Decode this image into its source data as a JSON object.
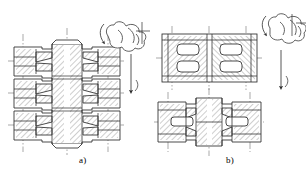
{
  "drawing": {
    "title": "Sectioned assembly views of a multi-port manifold body",
    "sheet_background": "#ffffff",
    "line_color": "#2b2b2b",
    "hatch_color": "#5a5a5a",
    "centerline_color": "#6e6e6e",
    "annotation_color": "#3a3a3a",
    "label_color": "#3b3b3b"
  },
  "figures": [
    {
      "id": "a",
      "label": "a)",
      "label_x": 79,
      "label_y": 156,
      "description": "Front full section of manifold with three stacked horizontal ports and a central vertical hub",
      "views": [
        {
          "name": "front-section",
          "x": 14,
          "y": 42,
          "width": 106,
          "height": 102,
          "section_hatched": true,
          "ports": 3,
          "symmetry_axis": "vertical-center"
        }
      ]
    },
    {
      "id": "b",
      "label": "b)",
      "label_x": 226,
      "label_y": 156,
      "description": "Plan section above and front section below of the mating manifold half",
      "views": [
        {
          "name": "top-section",
          "x": 162,
          "y": 34,
          "width": 95,
          "height": 48,
          "section_hatched": true,
          "cavities": 4,
          "symmetry_axis": "vertical-center"
        },
        {
          "name": "front-section",
          "x": 158,
          "y": 98,
          "width": 103,
          "height": 48,
          "section_hatched": true,
          "ports": 2,
          "symmetry_axis": "vertical-center"
        }
      ]
    }
  ],
  "annotations": [
    {
      "id": "cloud-a",
      "type": "revision-cloud-marker",
      "figure": "a",
      "x": 100,
      "y": 22,
      "width": 46,
      "height": 30,
      "has_leader_arrow": true,
      "leader_direction": "down-left",
      "has_extension_line": true
    },
    {
      "id": "flow-arrow-a",
      "type": "direction-arrow",
      "figure": "a",
      "x": 131,
      "y": 52,
      "length": 38,
      "direction": "down"
    },
    {
      "id": "cloud-b",
      "type": "revision-cloud-marker",
      "figure": "b",
      "x": 262,
      "y": 14,
      "width": 44,
      "height": 30,
      "has_leader_arrow": true,
      "leader_direction": "down-left",
      "has_extension_line": true
    },
    {
      "id": "flow-arrow-b",
      "type": "direction-arrow",
      "figure": "b",
      "x": 281,
      "y": 48,
      "length": 38,
      "direction": "down"
    }
  ],
  "line_styles": {
    "visible_edge": "solid",
    "centerline": "dash-dot",
    "hatch": "45deg parallel"
  }
}
